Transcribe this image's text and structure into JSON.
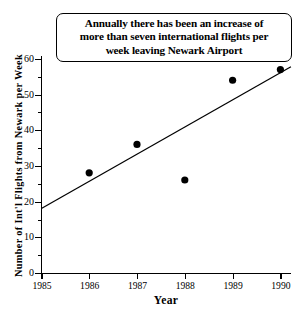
{
  "chart_data": {
    "type": "scatter",
    "title": "Annually there has been an increase of more than seven international flights per week leaving Newark Airport",
    "title_lines": [
      "Annually there has been an increase of",
      "more than seven international flights per",
      "week leaving Newark Airport"
    ],
    "xlabel": "Year",
    "ylabel": "Number of Int'l Flights from Newark per Week",
    "x": [
      1986,
      1987,
      1988,
      1989,
      1990
    ],
    "values": [
      28,
      36,
      26,
      54,
      57
    ],
    "categories": [
      "1986",
      "1987",
      "1988",
      "1989",
      "1990"
    ],
    "series": [
      {
        "name": "Int'l flights per week",
        "points": [
          {
            "x": 1986,
            "y": 28
          },
          {
            "x": 1987,
            "y": 36
          },
          {
            "x": 1988,
            "y": 26
          },
          {
            "x": 1989,
            "y": 54
          },
          {
            "x": 1990,
            "y": 57
          }
        ]
      },
      {
        "name": "trend line",
        "type": "line",
        "points": [
          {
            "x": 1985,
            "y": 18
          },
          {
            "x": 1990.22,
            "y": 57.8
          }
        ],
        "slope_per_year": 7.6,
        "intercept_1985": 18
      }
    ],
    "xlim": [
      1985,
      1990.2
    ],
    "ylim": [
      0,
      61
    ],
    "xticks": [
      "1985",
      "1986",
      "1987",
      "1988",
      "1989",
      "1990"
    ],
    "yticks": [
      "0",
      "10",
      "20",
      "30",
      "40",
      "50",
      "60"
    ],
    "ytick_values": [
      0,
      10,
      20,
      30,
      40,
      50,
      60
    ],
    "yminor_values": [
      5,
      15,
      25,
      35,
      45,
      55
    ],
    "grid": false,
    "legend": "none",
    "marker": "filled-circle",
    "marker_color": "#000000",
    "line_color": "#000000",
    "background_color": "#ffffff"
  },
  "axes": {
    "x_title": "Year",
    "y_title": "Number of Int'l Flights from Newark per Week",
    "x_ticks": [
      "1985",
      "1986",
      "1987",
      "1988",
      "1989",
      "1990"
    ],
    "y_ticks": [
      "60",
      "50",
      "40",
      "30",
      "20",
      "10",
      "0"
    ]
  },
  "annotation": {
    "line1": "Annually there has been an increase of",
    "line2": "more than seven international flights per",
    "line3": "week leaving Newark Airport"
  }
}
